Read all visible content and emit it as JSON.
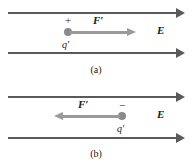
{
  "figure": {
    "width": 192,
    "height": 164,
    "background": "#ffffff",
    "field_line_color": "#5a5a5a",
    "force_arrow_color": "#9a9a9a",
    "charge_dot_color": "#8a8a8a",
    "text_color": "#1a1a1a"
  },
  "panels": [
    {
      "id": "a",
      "caption": "(a)",
      "charge_sign": "+",
      "charge_label": "q",
      "charge_prime": "′",
      "force_label": "F",
      "force_prime": "′",
      "force_direction": "right",
      "field_label": "E",
      "field_direction": "right"
    },
    {
      "id": "b",
      "caption": "(b)",
      "charge_sign": "−",
      "charge_label": "q",
      "charge_prime": "′",
      "force_label": "F",
      "force_prime": "′",
      "force_direction": "left",
      "field_label": "E",
      "field_direction": "right"
    }
  ]
}
